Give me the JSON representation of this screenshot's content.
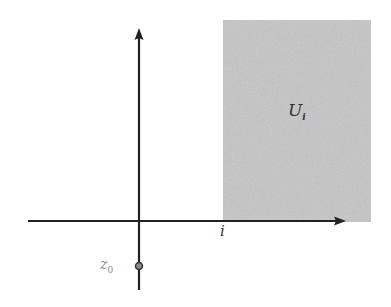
{
  "diagram": {
    "region": {
      "label_main": "U",
      "label_sub": "i",
      "fill": "#c8c8c8"
    },
    "point": {
      "label_main": "z",
      "label_sub": "0"
    },
    "axis_label": "i",
    "axis_color": "#222222"
  }
}
